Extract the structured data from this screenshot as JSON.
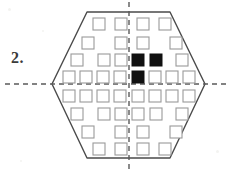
{
  "page": {
    "background_color": "#ffffff",
    "width": 234,
    "height": 177
  },
  "question": {
    "number_label": "2.",
    "label_color": "#3a3a3a"
  },
  "figure": {
    "name": "hexagon-with-square-grid",
    "outline_color": "#4a4a4a",
    "outline_width": 1.4,
    "symmetry_line_color": "#5a5a5a",
    "open_square_stroke": "#9a9a9a",
    "open_square_fill": "#ffffff",
    "filled_square_fill": "#111111",
    "hexagon_points": "87,12 170,12 205,84 170,158 87,158 52,84",
    "axes": [
      {
        "name": "vertical-symmetry-line",
        "orientation": "vertical",
        "x1": 129,
        "y1": 2,
        "x2": 129,
        "y2": 172
      },
      {
        "name": "horizontal-symmetry-line",
        "orientation": "horizontal",
        "x1": 5,
        "y1": 84,
        "x2": 229,
        "y2": 84
      }
    ],
    "square_size": 12,
    "squares": [
      {
        "id": "r1c1",
        "x": 93,
        "y": 18,
        "fill": "open"
      },
      {
        "id": "r1c2",
        "x": 115,
        "y": 18,
        "fill": "open"
      },
      {
        "id": "r1c3",
        "x": 137,
        "y": 18,
        "fill": "open"
      },
      {
        "id": "r1c4",
        "x": 159,
        "y": 18,
        "fill": "open"
      },
      {
        "id": "r2c1",
        "x": 82,
        "y": 37,
        "fill": "open"
      },
      {
        "id": "r2c2",
        "x": 115,
        "y": 37,
        "fill": "open"
      },
      {
        "id": "r2c3",
        "x": 137,
        "y": 37,
        "fill": "open"
      },
      {
        "id": "r2c4",
        "x": 170,
        "y": 37,
        "fill": "open"
      },
      {
        "id": "r3c1",
        "x": 71,
        "y": 54,
        "fill": "open"
      },
      {
        "id": "r3c2",
        "x": 98,
        "y": 54,
        "fill": "open"
      },
      {
        "id": "r3c3",
        "x": 115,
        "y": 54,
        "fill": "open"
      },
      {
        "id": "r3c4",
        "x": 132,
        "y": 54,
        "fill": "filled"
      },
      {
        "id": "r3c5",
        "x": 150,
        "y": 54,
        "fill": "filled"
      },
      {
        "id": "r3c6",
        "x": 176,
        "y": 54,
        "fill": "open"
      },
      {
        "id": "r4c1",
        "x": 63,
        "y": 71,
        "fill": "open"
      },
      {
        "id": "r4c2",
        "x": 80,
        "y": 71,
        "fill": "open"
      },
      {
        "id": "r4c3",
        "x": 97,
        "y": 71,
        "fill": "open"
      },
      {
        "id": "r4c4",
        "x": 114,
        "y": 71,
        "fill": "open"
      },
      {
        "id": "r4c5",
        "x": 132,
        "y": 71,
        "fill": "filled"
      },
      {
        "id": "r4c6",
        "x": 149,
        "y": 71,
        "fill": "open"
      },
      {
        "id": "r4c7",
        "x": 166,
        "y": 71,
        "fill": "open"
      },
      {
        "id": "r4c8",
        "x": 183,
        "y": 71,
        "fill": "open"
      },
      {
        "id": "r5c1",
        "x": 63,
        "y": 90,
        "fill": "open"
      },
      {
        "id": "r5c2",
        "x": 80,
        "y": 90,
        "fill": "open"
      },
      {
        "id": "r5c3",
        "x": 97,
        "y": 90,
        "fill": "open"
      },
      {
        "id": "r5c4",
        "x": 114,
        "y": 90,
        "fill": "open"
      },
      {
        "id": "r5c5",
        "x": 132,
        "y": 90,
        "fill": "open"
      },
      {
        "id": "r5c6",
        "x": 149,
        "y": 90,
        "fill": "open"
      },
      {
        "id": "r5c7",
        "x": 166,
        "y": 90,
        "fill": "open"
      },
      {
        "id": "r5c8",
        "x": 183,
        "y": 90,
        "fill": "open"
      },
      {
        "id": "r6c1",
        "x": 71,
        "y": 108,
        "fill": "open"
      },
      {
        "id": "r6c2",
        "x": 98,
        "y": 108,
        "fill": "open"
      },
      {
        "id": "r6c3",
        "x": 115,
        "y": 108,
        "fill": "open"
      },
      {
        "id": "r6c4",
        "x": 132,
        "y": 108,
        "fill": "open"
      },
      {
        "id": "r6c5",
        "x": 150,
        "y": 108,
        "fill": "open"
      },
      {
        "id": "r6c6",
        "x": 176,
        "y": 108,
        "fill": "open"
      },
      {
        "id": "r7c1",
        "x": 82,
        "y": 126,
        "fill": "open"
      },
      {
        "id": "r7c2",
        "x": 115,
        "y": 126,
        "fill": "open"
      },
      {
        "id": "r7c3",
        "x": 137,
        "y": 126,
        "fill": "open"
      },
      {
        "id": "r7c4",
        "x": 170,
        "y": 126,
        "fill": "open"
      },
      {
        "id": "r8c1",
        "x": 93,
        "y": 143,
        "fill": "open"
      },
      {
        "id": "r8c2",
        "x": 115,
        "y": 143,
        "fill": "open"
      },
      {
        "id": "r8c3",
        "x": 137,
        "y": 143,
        "fill": "open"
      },
      {
        "id": "r8c4",
        "x": 159,
        "y": 143,
        "fill": "open"
      }
    ]
  }
}
